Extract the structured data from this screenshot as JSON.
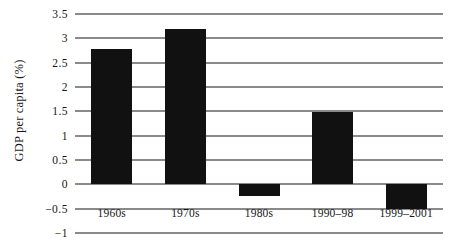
{
  "chart_data": {
    "type": "bar",
    "title": "",
    "xlabel": "",
    "ylabel": "GDP per capita (%)",
    "categories": [
      "1960s",
      "1970s",
      "1980s",
      "1990–98",
      "1999–2001"
    ],
    "values": [
      2.78,
      3.2,
      -0.25,
      1.48,
      -0.5
    ],
    "series": [
      {
        "name": "GDP per capita growth",
        "values": [
          2.78,
          3.2,
          -0.25,
          1.48,
          -0.5
        ]
      }
    ],
    "ylim": [
      -1,
      3.5
    ],
    "yticks": [
      3.5,
      3,
      2.5,
      2,
      1.5,
      1,
      0.5,
      0,
      -0.5,
      -1
    ],
    "ytick_labels": [
      "3.5",
      "3",
      "2.5",
      "2",
      "1.5",
      "1",
      "0.5",
      "0",
      "−0.5",
      "−1"
    ],
    "grid": true,
    "legend": false,
    "legend_position": "none",
    "bar_color": "#111111",
    "grid_color": "#8a8a8a",
    "background_color": "#ffffff"
  }
}
